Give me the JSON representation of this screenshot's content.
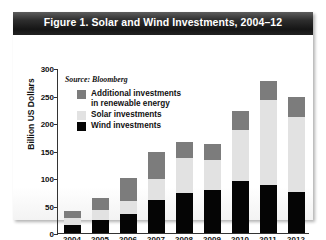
{
  "figure": {
    "title": "Figure 1. Solar and Wind Investments, 2004–12",
    "source": "Source: Bloomberg"
  },
  "colors": {
    "additional": "#7c7c7c",
    "solar": "#e2e2e2",
    "wind": "#050505",
    "title_band": "#1d1d1d",
    "axis": "#333333",
    "background": "#ffffff"
  },
  "legend": {
    "items": [
      {
        "label": "Additional investments\nin renewable energy",
        "color_key": "additional",
        "swatch": "additional-swatch"
      },
      {
        "label": "Solar investments",
        "color_key": "solar",
        "swatch": "solar-swatch"
      },
      {
        "label": "Wind investments",
        "color_key": "wind",
        "swatch": "wind-swatch"
      }
    ]
  },
  "axes": {
    "ylabel": "Billion US Dollars",
    "yticks": [
      "0",
      "50",
      "100",
      "150",
      "200",
      "250",
      "300"
    ],
    "ytick_values": [
      0,
      50,
      100,
      150,
      200,
      250,
      300
    ],
    "ymin": 0,
    "ymax": 300,
    "xticks": [
      "2004",
      "2005",
      "2006",
      "2007",
      "2008",
      "2009",
      "2010",
      "2011",
      "2012"
    ]
  },
  "chart_data": {
    "type": "bar",
    "stacked": true,
    "title": "Figure 1. Solar and Wind Investments, 2004–12",
    "subtitle": "Source: Bloomberg",
    "xlabel": "",
    "ylabel": "Billion US Dollars",
    "ylim": [
      0,
      300
    ],
    "ytick_interval": 50,
    "grid": false,
    "legend_position": "upper-left-inside",
    "categories": [
      "2004",
      "2005",
      "2006",
      "2007",
      "2008",
      "2009",
      "2010",
      "2011",
      "2012"
    ],
    "series": [
      {
        "name": "Wind investments",
        "color": "#050505",
        "values": [
          14,
          24,
          34,
          60,
          72,
          78,
          94,
          88,
          74
        ]
      },
      {
        "name": "Solar investments",
        "color": "#e2e2e2",
        "values": [
          14,
          18,
          24,
          38,
          64,
          54,
          94,
          153,
          137
        ]
      },
      {
        "name": "Additional investments in renewable energy",
        "color": "#7c7c7c",
        "values": [
          12,
          22,
          42,
          50,
          30,
          30,
          34,
          36,
          36
        ]
      }
    ],
    "totals": [
      40,
      64,
      100,
      148,
      166,
      162,
      222,
      277,
      247
    ]
  }
}
